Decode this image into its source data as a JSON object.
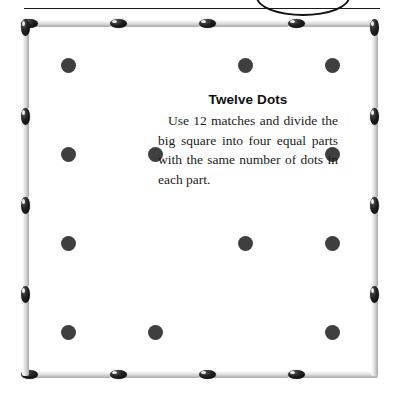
{
  "page": {
    "width": 398,
    "height": 401,
    "background": "#ffffff"
  },
  "decoration": {
    "rule_name": "horizontal-rule",
    "arc_name": "curved-arc-fragment",
    "line_color": "#1a1a1a"
  },
  "puzzle": {
    "title": "Twelve Dots",
    "body": "Use 12 matches and divide the big square into four equal parts with the same number of dots in each part.",
    "match_count": 12,
    "dot_count": 12
  },
  "colors": {
    "dot": "#3f3f3f",
    "match_head": "#000000",
    "match_body": "#dcdcdc",
    "text": "#1c1c1c",
    "title": "#101010"
  },
  "square": {
    "left": 22,
    "top": 20,
    "width": 356,
    "height": 358,
    "matches_per_side": 3,
    "total_matches": 12
  },
  "matches": {
    "top": [
      {
        "x": 0,
        "y": 0,
        "len": 89,
        "head_at": 0
      },
      {
        "x": 89,
        "y": 0,
        "len": 89,
        "head_at": 0
      },
      {
        "x": 178,
        "y": 0,
        "len": 89,
        "head_at": 0
      },
      {
        "x": 267,
        "y": 0,
        "len": 89,
        "head_at": 0
      }
    ],
    "right": [
      {
        "x": 0,
        "y": 0,
        "len": 89,
        "head_at": 0
      },
      {
        "x": 0,
        "y": 89,
        "len": 89,
        "head_at": 0
      },
      {
        "x": 0,
        "y": 178,
        "len": 89,
        "head_at": 0
      },
      {
        "x": 0,
        "y": 267,
        "len": 89,
        "head_at": 0
      }
    ],
    "bottom": [
      {
        "x": 0,
        "y": 0,
        "len": 89,
        "head_at": 0
      },
      {
        "x": 89,
        "y": 0,
        "len": 89,
        "head_at": 0
      },
      {
        "x": 178,
        "y": 0,
        "len": 89,
        "head_at": 0
      },
      {
        "x": 267,
        "y": 0,
        "len": 89,
        "head_at": 0
      }
    ],
    "left": [
      {
        "x": 0,
        "y": 0,
        "len": 89,
        "head_at": 0
      },
      {
        "x": 0,
        "y": 89,
        "len": 89,
        "head_at": 0
      },
      {
        "x": 0,
        "y": 178,
        "len": 89,
        "head_at": 0
      },
      {
        "x": 0,
        "y": 267,
        "len": 89,
        "head_at": 0
      }
    ]
  },
  "dots": [
    {
      "id": "dot-r1c1",
      "x": 61,
      "y": 58
    },
    {
      "id": "dot-r1c2",
      "x": 238,
      "y": 58
    },
    {
      "id": "dot-r1c3",
      "x": 325,
      "y": 58
    },
    {
      "id": "dot-r2c1",
      "x": 61,
      "y": 147
    },
    {
      "id": "dot-r2c2",
      "x": 148,
      "y": 147
    },
    {
      "id": "dot-r2c3",
      "x": 325,
      "y": 147
    },
    {
      "id": "dot-r3c1",
      "x": 61,
      "y": 236
    },
    {
      "id": "dot-r3c2",
      "x": 238,
      "y": 236
    },
    {
      "id": "dot-r3c3",
      "x": 325,
      "y": 236
    },
    {
      "id": "dot-r4c1",
      "x": 61,
      "y": 325
    },
    {
      "id": "dot-r4c2",
      "x": 148,
      "y": 325
    },
    {
      "id": "dot-r4c3",
      "x": 325,
      "y": 325
    }
  ]
}
